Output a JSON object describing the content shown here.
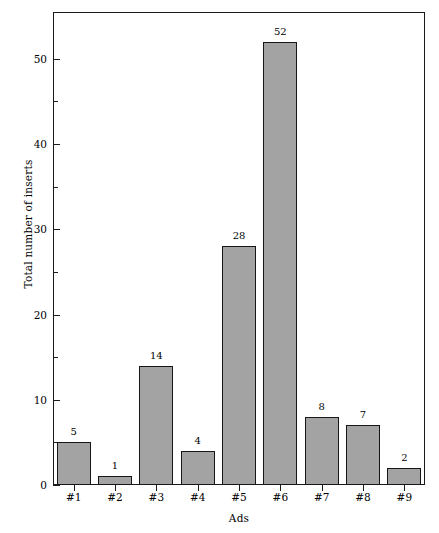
{
  "chart_data": {
    "type": "bar",
    "title": "",
    "subtitle": "",
    "xlabel": "Ads",
    "ylabel": "Total number of inserts",
    "categories": [
      "#1",
      "#2",
      "#3",
      "#4",
      "#5",
      "#6",
      "#7",
      "#8",
      "#9"
    ],
    "values": [
      5,
      1,
      14,
      4,
      28,
      52,
      8,
      7,
      2
    ],
    "value_labels": [
      "5",
      "1",
      "14",
      "4",
      "28",
      "52",
      "8",
      "7",
      "2"
    ],
    "ylim": [
      0,
      55.5
    ],
    "y_ticks_major": [
      0,
      10,
      20,
      30,
      40,
      50
    ],
    "y_tick_labels": [
      "0",
      "10",
      "20",
      "30",
      "40",
      "50"
    ],
    "y_ticks_minor": [
      5,
      15,
      25,
      35,
      45
    ],
    "grid": false,
    "legend": null,
    "legend_position": "none",
    "bar_fill_color": "#a3a3a3",
    "bar_edge_color": "#161616",
    "axis_color": "#1a1a1a",
    "background_color": "#ffffff"
  }
}
